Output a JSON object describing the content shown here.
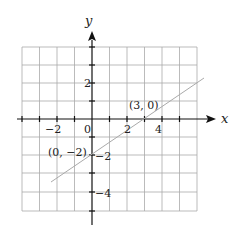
{
  "diagram": {
    "type": "coordinate-plane",
    "axes": {
      "x_label": "x",
      "y_label": "y"
    },
    "x_range": [
      -4,
      6
    ],
    "y_range": [
      -5,
      4
    ],
    "x_tick_labels": [
      "−2",
      "0",
      "2",
      "4"
    ],
    "y_tick_labels": [
      "2",
      "−2",
      "−4"
    ],
    "line": {
      "equation": "y = (2/3)x - 2",
      "from": [
        -2.3,
        -3.5
      ],
      "to": [
        6.3,
        2.3
      ]
    },
    "points": [
      {
        "label": "(3, 0)",
        "x": 3,
        "y": 0
      },
      {
        "label": "(0, −2)",
        "x": 0,
        "y": -2
      }
    ]
  }
}
